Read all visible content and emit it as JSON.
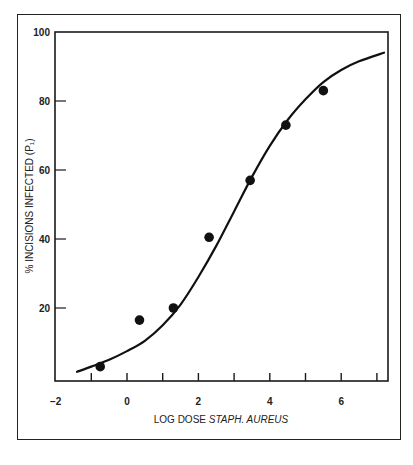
{
  "chart_data": {
    "type": "scatter",
    "title": "",
    "xlabel": "LOG DOSE STAPH. AUREUS",
    "xlabel_plain": "LOG DOSE",
    "xlabel_italic": "STAPH. AUREUS",
    "ylabel": "% INCISIONS INFECTED (P₁)",
    "xlim": [
      -2,
      7.3
    ],
    "ylim": [
      0,
      100
    ],
    "x_ticks": [
      -1,
      0,
      1,
      2,
      3,
      4,
      5,
      6,
      7
    ],
    "x_tick_labels": [
      "-2",
      "0",
      "2",
      "4",
      "6"
    ],
    "x_tick_label_values": [
      -2,
      0,
      2,
      4,
      6
    ],
    "y_ticks": [
      20,
      40,
      60,
      80,
      100
    ],
    "y_tick_labels": [
      "20",
      "40",
      "60",
      "80",
      "100"
    ],
    "grid": false,
    "legend": null,
    "series": [
      {
        "name": "Observed",
        "type": "scatter",
        "x": [
          -0.75,
          0.35,
          1.3,
          2.3,
          3.45,
          4.45,
          5.5
        ],
        "y": [
          3,
          16.5,
          20,
          40.5,
          57,
          73,
          83
        ]
      },
      {
        "name": "Fitted sigmoid curve",
        "type": "line",
        "x": [
          -1.4,
          -1.0,
          -0.5,
          0,
          0.5,
          1.0,
          1.5,
          2.0,
          2.5,
          3.0,
          3.5,
          4.0,
          4.5,
          5.0,
          5.5,
          6.0,
          6.5,
          7.2
        ],
        "y": [
          1.5,
          3,
          5,
          7.5,
          10.5,
          15,
          21,
          29,
          38,
          48,
          58,
          67,
          74.5,
          80.5,
          85.5,
          89,
          91.5,
          94
        ]
      }
    ]
  }
}
